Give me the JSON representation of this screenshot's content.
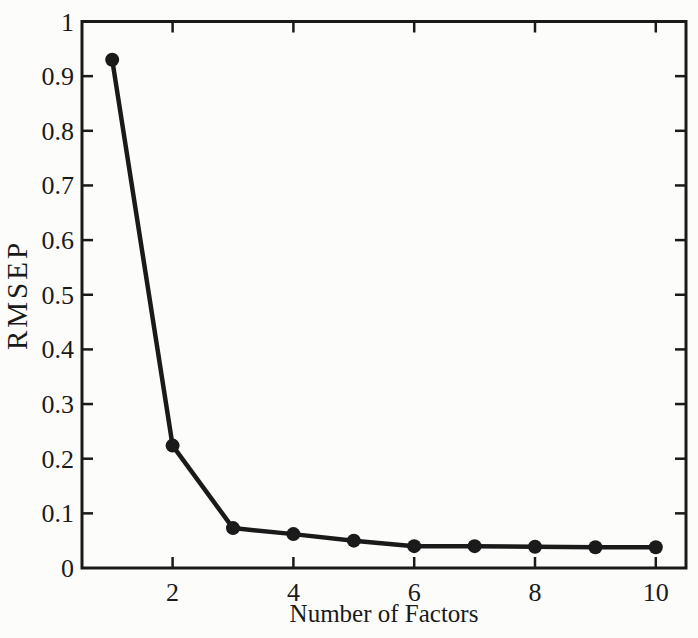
{
  "chart_data": {
    "type": "line",
    "title": "",
    "xlabel": "Number of Factors",
    "ylabel": "RMSEP",
    "series": [
      {
        "name": "RMSEP",
        "x": [
          1,
          2,
          3,
          4,
          5,
          6,
          7,
          8,
          9,
          10
        ],
        "values": [
          0.93,
          0.224,
          0.073,
          0.062,
          0.05,
          0.04,
          0.04,
          0.039,
          0.038,
          0.038
        ]
      }
    ],
    "xlim": [
      0.5,
      10.5
    ],
    "ylim": [
      0,
      1
    ],
    "xticks": [
      2,
      4,
      6,
      8,
      10
    ],
    "xtick_labels": [
      "2",
      "4",
      "6",
      "8",
      "10"
    ],
    "yticks": [
      0,
      0.1,
      0.2,
      0.3,
      0.4,
      0.5,
      0.6,
      0.7,
      0.8,
      0.9,
      1
    ],
    "ytick_labels": [
      "0",
      "0.1",
      "0.2",
      "0.3",
      "0.4",
      "0.5",
      "0.6",
      "0.7",
      "0.8",
      "0.9",
      "1"
    ],
    "grid": false,
    "legend": null,
    "box": true,
    "marker": "filled-circle",
    "line_color": "#1a1a1a",
    "marker_color": "#1a1a1a",
    "axis_color": "#1a1a1a",
    "text_color": "#1a1a1a",
    "background_color": "#fcfcfa"
  }
}
